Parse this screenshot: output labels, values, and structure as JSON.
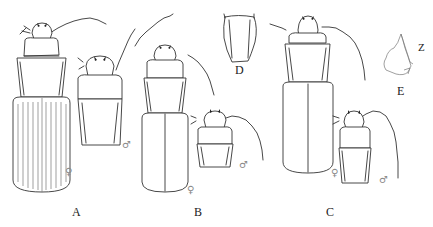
{
  "figure": {
    "panels": [
      {
        "id": "A",
        "label": "A",
        "specimens": [
          {
            "sex": "♀",
            "view": "whole body"
          },
          {
            "sex": "♂",
            "view": "head and pronotum"
          }
        ]
      },
      {
        "id": "B",
        "label": "B",
        "specimens": [
          {
            "sex": "♀",
            "view": "whole body"
          },
          {
            "sex": "♂",
            "view": "head and pronotum"
          }
        ]
      },
      {
        "id": "C",
        "label": "C",
        "specimens": [
          {
            "sex": "♀",
            "view": "whole body"
          },
          {
            "sex": "♂",
            "view": "head and pronotum"
          }
        ]
      },
      {
        "id": "D",
        "label": "D",
        "specimens": [
          {
            "view": "pronotum outline"
          }
        ]
      },
      {
        "id": "E",
        "label": "E",
        "annotation": "Z",
        "specimens": [
          {
            "view": "structure detail"
          }
        ]
      }
    ],
    "symbols": {
      "female": "♀",
      "male": "♂"
    },
    "colors": {
      "line": "#333333",
      "background": "#ffffff",
      "label": "#222222",
      "sex_symbol": "#888888"
    }
  }
}
